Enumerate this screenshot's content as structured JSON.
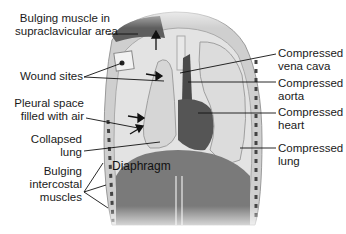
{
  "diagram": {
    "left_labels": [
      {
        "lines": [
          "Bulging muscle in",
          "supraclavicular area"
        ]
      },
      {
        "lines": [
          "Wound sites"
        ]
      },
      {
        "lines": [
          "Pleural space",
          "filled with air"
        ]
      },
      {
        "lines": [
          "Collapsed",
          "lung"
        ]
      },
      {
        "lines": [
          "Bulging",
          "intercostal",
          "muscles"
        ]
      }
    ],
    "right_labels": [
      {
        "lines": [
          "Compressed",
          "vena cava"
        ]
      },
      {
        "lines": [
          "Compressed",
          "aorta"
        ]
      },
      {
        "lines": [
          "Compressed",
          "heart"
        ]
      },
      {
        "lines": [
          "Compressed",
          "lung"
        ]
      }
    ],
    "center_label": "Diaphragm",
    "colors": {
      "muscle_dark": "#5e5e5e",
      "diaphragm": "#7a7a7a",
      "lung_light": "#d9d9d9",
      "chest_wall": "#c8c8c8",
      "background": "#ffffff",
      "leader_line": "#111111"
    }
  }
}
